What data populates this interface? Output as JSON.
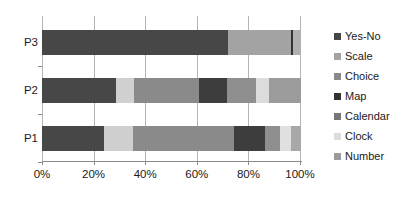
{
  "chart_data": {
    "type": "bar",
    "orientation": "horizontal",
    "stacked": true,
    "normalized": "100%",
    "title": "",
    "xlabel": "",
    "ylabel": "",
    "xlim": [
      0,
      100
    ],
    "grid": true,
    "legend_position": "right",
    "categories": [
      "P1",
      "P2",
      "P3"
    ],
    "category_order_top_to_bottom": [
      "P3",
      "P2",
      "P1"
    ],
    "xticks": [
      0,
      20,
      40,
      60,
      80,
      100
    ],
    "xticklabels": [
      "0%",
      "20%",
      "40%",
      "60%",
      "80%",
      "100%"
    ],
    "series": [
      {
        "name": "Yes-No",
        "color": "#474747",
        "values": [
          24,
          28.5,
          72
        ]
      },
      {
        "name": "Scale",
        "color": "#a3a3a3",
        "values": [
          0,
          0,
          24
        ]
      },
      {
        "name": "Choice",
        "color": "#8a8a8a",
        "values": [
          39,
          25,
          0
        ]
      },
      {
        "name": "Map",
        "color": "#333333",
        "values": [
          12,
          11,
          1
        ]
      },
      {
        "name": "Calendar",
        "color": "#767676",
        "values": [
          6,
          11,
          0
        ]
      },
      {
        "name": "Clock",
        "color": "#dcdcdc",
        "values": [
          11,
          7,
          0
        ]
      },
      {
        "name": "Number",
        "color": "#9b9b9b",
        "values": [
          8,
          17.5,
          3
        ]
      }
    ],
    "bars": [
      {
        "category": "P3",
        "segments": [
          {
            "series": "Yes-No",
            "value": 72,
            "color": "#474747"
          },
          {
            "series": "Scale",
            "value": 24,
            "color": "#a3a3a3"
          },
          {
            "series": "Map",
            "value": 1,
            "color": "#333333"
          },
          {
            "series": "Number",
            "value": 3,
            "color": "#b0b0b0"
          }
        ]
      },
      {
        "category": "P2",
        "segments": [
          {
            "series": "Yes-No",
            "value": 28.5,
            "color": "#474747"
          },
          {
            "series": "Clock",
            "value": 7,
            "color": "#d0d0d0"
          },
          {
            "series": "Choice",
            "value": 25,
            "color": "#8a8a8a"
          },
          {
            "series": "Map",
            "value": 11,
            "color": "#3d3d3d"
          },
          {
            "series": "Calendar",
            "value": 11,
            "color": "#8f8f8f"
          },
          {
            "series": "Clock",
            "value": 5,
            "color": "#dcdcdc"
          },
          {
            "series": "Number",
            "value": 12.5,
            "color": "#9b9b9b"
          }
        ]
      },
      {
        "category": "P1",
        "segments": [
          {
            "series": "Yes-No",
            "value": 24,
            "color": "#474747"
          },
          {
            "series": "Clock",
            "value": 11,
            "color": "#cfcfcf"
          },
          {
            "series": "Choice",
            "value": 39,
            "color": "#8a8a8a"
          },
          {
            "series": "Map",
            "value": 12,
            "color": "#3d3d3d"
          },
          {
            "series": "Calendar",
            "value": 6,
            "color": "#8f8f8f"
          },
          {
            "series": "Clock",
            "value": 4,
            "color": "#e0e0e0"
          },
          {
            "series": "Number",
            "value": 4,
            "color": "#a8a8a8"
          }
        ]
      }
    ]
  },
  "legend": {
    "items": [
      {
        "label": "Yes-No",
        "color": "#474747"
      },
      {
        "label": "Scale",
        "color": "#a3a3a3"
      },
      {
        "label": "Choice",
        "color": "#8a8a8a"
      },
      {
        "label": "Map",
        "color": "#333333"
      },
      {
        "label": "Calendar",
        "color": "#767676"
      },
      {
        "label": "Clock",
        "color": "#dcdcdc"
      },
      {
        "label": "Number",
        "color": "#9b9b9b"
      }
    ]
  },
  "axis": {
    "x_labels": [
      "0%",
      "20%",
      "40%",
      "60%",
      "80%",
      "100%"
    ],
    "y_labels_top_to_bottom": [
      "P3",
      "P2",
      "P1"
    ]
  }
}
